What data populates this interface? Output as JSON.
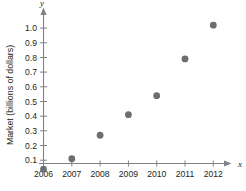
{
  "chart_data": {
    "type": "scatter",
    "title": "",
    "xlabel": "x",
    "ylabel": "Market (billions of dollars)",
    "x": [
      2006,
      2007,
      2008,
      2009,
      2010,
      2011,
      2012
    ],
    "values": [
      0.04,
      0.11,
      0.27,
      0.41,
      0.54,
      0.79,
      1.02
    ],
    "categories": [
      "2006",
      "2007",
      "2008",
      "2009",
      "2010",
      "2011",
      "2012"
    ],
    "xtick_labels": [
      "2006",
      "2007",
      "2008",
      "2009",
      "2010",
      "2011",
      "2012"
    ],
    "ytick_labels": [
      "0.1",
      "0.2",
      "0.3",
      "0.4",
      "0.5",
      "0.6",
      "0.7",
      "0.8",
      "0.9",
      "1.0"
    ],
    "ytick_values": [
      0.1,
      0.2,
      0.3,
      0.4,
      0.5,
      0.6,
      0.7,
      0.8,
      0.9,
      1.0
    ],
    "xlim": [
      2006,
      2012
    ],
    "ylim": [
      0,
      1.05
    ],
    "grid": false,
    "legend": false,
    "axis_name_x": "x",
    "axis_name_y": "y",
    "point_color": "#6d6e71",
    "axis_color": "#808285",
    "text_color": "#231f20",
    "background_color": "#ffffff"
  },
  "axis_names": {
    "x": "x",
    "y": "y"
  },
  "y_axis_title": "Market (billions of dollars)"
}
